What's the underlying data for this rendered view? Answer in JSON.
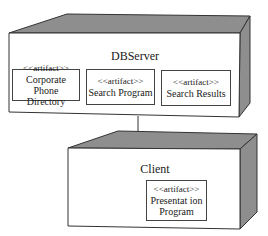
{
  "diagram_type": "UML deployment diagram",
  "nodes": [
    {
      "name": "DBServer",
      "artifacts": [
        {
          "stereotype": "<<artifact>>",
          "line1": "Corporate Phone",
          "line2": "Directory"
        },
        {
          "stereotype": "<<artifact>>",
          "line1": "Search Program",
          "line2": ""
        },
        {
          "stereotype": "<<artifact>>",
          "line1": "Search Results",
          "line2": ""
        }
      ]
    },
    {
      "name": "Client",
      "artifacts": [
        {
          "stereotype": "<<artifact>>",
          "line1": "Presentat ion",
          "line2": "Program"
        }
      ]
    }
  ],
  "connections": [
    {
      "from": "DBServer",
      "to": "Client"
    }
  ],
  "colors": {
    "node_face": "#ffffff",
    "node_shade": "#8c8c8c",
    "outline": "#333333"
  }
}
